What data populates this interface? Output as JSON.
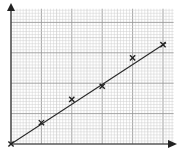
{
  "chart_data": {
    "type": "scatter",
    "title": "",
    "xlabel": "",
    "ylabel": "",
    "x_ticks": [],
    "y_ticks": [],
    "grid": true,
    "legend": null,
    "note": "Graph paper with unlabeled axes; values in major-grid units (1 unit = 10 minor squares)",
    "series": [
      {
        "name": "data points",
        "marker": "x",
        "x": [
          0,
          1,
          2,
          3,
          4,
          5
        ],
        "y": [
          0,
          0.7,
          1.47,
          1.9,
          2.83,
          3.27
        ]
      },
      {
        "name": "line of best fit",
        "type": "line",
        "x": [
          0,
          5.1
        ],
        "y": [
          0,
          3.33
        ]
      }
    ],
    "xlim": [
      0,
      5.35
    ],
    "ylim": [
      0,
      4.45
    ]
  },
  "colors": {
    "background": "#ffffff",
    "minor_grid": "#cfcfcf",
    "major_grid": "#9a9a9a",
    "axis": "#333333",
    "line": "#2a2a2a",
    "marker": "#222222"
  }
}
